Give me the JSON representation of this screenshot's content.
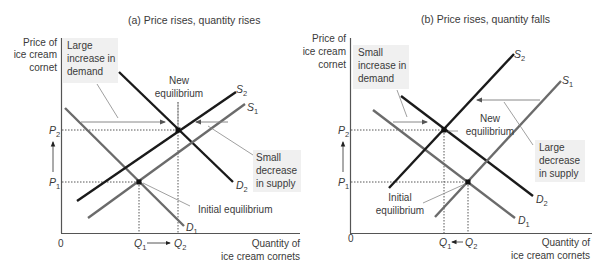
{
  "panels": [
    {
      "id": "a",
      "title": "(a) Price rises, quantity rises",
      "y_axis_label": [
        "Price of",
        "ice cream",
        "cornet"
      ],
      "x_axis_label": [
        "Quantity of",
        "ice cream cornets"
      ],
      "origin": "0",
      "price_labels": {
        "p1": "P",
        "p1_sub": "1",
        "p2": "P",
        "p2_sub": "2"
      },
      "quantity_labels": {
        "q1": "Q",
        "q1_sub": "1",
        "q2": "Q",
        "q2_sub": "2"
      },
      "curves": {
        "d1": {
          "name": "D",
          "sub": "1"
        },
        "d2": {
          "name": "D",
          "sub": "2"
        },
        "s1": {
          "name": "S",
          "sub": "1"
        },
        "s2": {
          "name": "S",
          "sub": "2"
        }
      },
      "annotations": {
        "demand_shift": [
          "Large",
          "increase in",
          "demand"
        ],
        "new_equilibrium": [
          "New",
          "equilibrium"
        ],
        "supply_shift": [
          "Small",
          "decrease",
          "in supply"
        ],
        "initial_equilibrium": [
          "Initial equilibrium"
        ]
      }
    },
    {
      "id": "b",
      "title": "(b) Price rises, quantity falls",
      "y_axis_label": [
        "Price of",
        "ice cream",
        "cornet"
      ],
      "x_axis_label": [
        "Quantity of",
        "ice cream cornets"
      ],
      "origin": "0",
      "price_labels": {
        "p1": "P",
        "p1_sub": "1",
        "p2": "P",
        "p2_sub": "2"
      },
      "quantity_labels": {
        "q1": "Q",
        "q1_sub": "1",
        "q2": "Q",
        "q2_sub": "2"
      },
      "curves": {
        "d1": {
          "name": "D",
          "sub": "1"
        },
        "d2": {
          "name": "D",
          "sub": "2"
        },
        "s1": {
          "name": "S",
          "sub": "1"
        },
        "s2": {
          "name": "S",
          "sub": "2"
        }
      },
      "annotations": {
        "demand_shift": [
          "Small",
          "increase in",
          "demand"
        ],
        "new_equilibrium": [
          "New",
          "equilibrium"
        ],
        "supply_shift": [
          "Large",
          "decrease",
          "in supply"
        ],
        "initial_equilibrium": [
          "Initial",
          "equilibrium"
        ]
      }
    }
  ],
  "colors": {
    "axis": "#555555",
    "original_curve": "#6b6b6b",
    "shifted_curve": "#1a1a1a",
    "leader": "#8a8a8a",
    "label_bg": "#f0f0f0"
  }
}
